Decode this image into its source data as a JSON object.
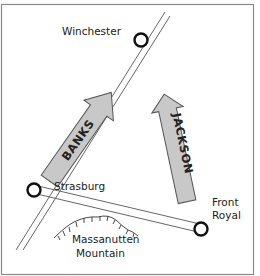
{
  "map": {
    "title": "",
    "colors": {
      "border": "#8a8a8a",
      "road": "#555555",
      "town_ring": "#111111",
      "arrow_fill": "#c8c8c8",
      "arrow_stroke": "#555555",
      "text": "#1a1a1a"
    },
    "towns": [
      {
        "name": "Winchester",
        "x": 141,
        "y": 40
      },
      {
        "name": "Strasburg",
        "x": 34,
        "y": 190
      },
      {
        "name": "Front Royal",
        "line1": "Front",
        "line2": "Royal",
        "x": 200,
        "y": 229
      }
    ],
    "armies": [
      {
        "name": "BANKS",
        "direction": "north-east"
      },
      {
        "name": "JACKSON",
        "direction": "north"
      }
    ],
    "terrain": [
      {
        "name": "Massanutten Mountain",
        "line1": "Massanutten",
        "line2": "Mountain"
      }
    ]
  }
}
